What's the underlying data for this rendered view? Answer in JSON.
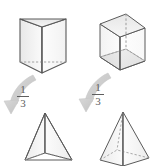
{
  "figure": {
    "background_color": "#ffffff"
  },
  "colors": {
    "outline": "#5a5a5a",
    "face_light": "#fbfbfb",
    "face_mid": "#f0f0f0",
    "face_shade": "#e2e2e2",
    "face_dark": "#d4d4d4",
    "hidden_edge": "#9a9a9a",
    "arrow_fill": "#cfcfcf",
    "arrow_stroke": "#bdbdbd",
    "text": "#5e5e5e"
  },
  "shapes": [
    {
      "id": "triangular-prism",
      "name": "triangular-prism",
      "label": "",
      "position": "top-left",
      "kind": "prism",
      "base": "triangle",
      "hidden_edges": true
    },
    {
      "id": "rectangular-prism",
      "name": "rectangular-prism",
      "label": "",
      "position": "top-right",
      "kind": "prism",
      "base": "square",
      "hidden_edges": true
    },
    {
      "id": "triangular-pyramid",
      "name": "triangular-pyramid",
      "label": "",
      "position": "bottom-left",
      "kind": "pyramid",
      "base": "triangle",
      "hidden_edges": true
    },
    {
      "id": "square-pyramid",
      "name": "square-pyramid",
      "label": "",
      "position": "bottom-right",
      "kind": "pyramid",
      "base": "square",
      "hidden_edges": true
    }
  ],
  "arrows": [
    {
      "id": "arrow-left",
      "name": "curved-arrow-left",
      "from": "triangular-prism",
      "to": "triangular-pyramid",
      "direction": "down-left"
    },
    {
      "id": "arrow-right",
      "name": "curved-arrow-right",
      "from": "rectangular-prism",
      "to": "square-pyramid",
      "direction": "down-left"
    }
  ],
  "labels": {
    "left_fraction": {
      "numerator": "1",
      "denominator": "3"
    },
    "right_fraction": {
      "numerator": "1",
      "denominator": "3"
    }
  }
}
